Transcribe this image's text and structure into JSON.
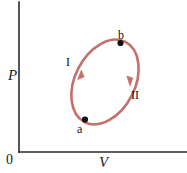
{
  "figure": {
    "type": "pv-cycle-diagram",
    "background_color": "#ffffff",
    "axes": {
      "color": "#2b2b2b",
      "y_axis_label": "P",
      "x_axis_label": "V",
      "origin_label": "0",
      "y_axis_x": 19,
      "y_axis_top": 2,
      "y_axis_bottom": 152,
      "x_axis_y": 152,
      "x_axis_left": 19,
      "x_axis_right": 187
    },
    "cycle": {
      "shape": "ellipse",
      "stroke_color": "#c4706a",
      "stroke_width": 2.6,
      "center_x": 105,
      "center_y": 82,
      "radius_x": 30,
      "radius_y": 45,
      "rotation_deg": 27,
      "direction": "clockwise"
    },
    "points": [
      {
        "label": "a",
        "x": 85,
        "y": 119.5,
        "marker_color": "#111111",
        "marker_radius": 3.1,
        "label_dx": -8,
        "label_dy": 10
      },
      {
        "label": "b",
        "x": 120.5,
        "y": 43,
        "marker_color": "#111111",
        "marker_radius": 3.1,
        "label_dx": -2,
        "label_dy": -12
      }
    ],
    "branches": [
      {
        "label": "I",
        "side": "left",
        "arrow_x": 81,
        "arrow_y": 72,
        "arrow_direction": "up",
        "label_x": 66,
        "label_y": 56
      },
      {
        "label": "II",
        "side": "right",
        "arrow_x": 130,
        "arrow_y": 83,
        "arrow_direction": "down",
        "label_x": 131,
        "label_y": 89
      }
    ]
  }
}
